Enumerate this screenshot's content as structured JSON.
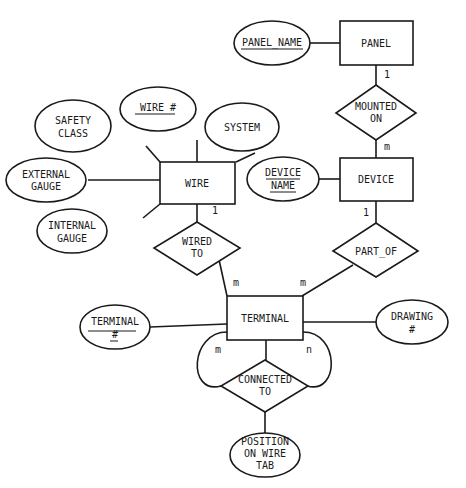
{
  "diagram": {
    "type": "entity-relationship",
    "entities": [
      {
        "id": "panel",
        "label": "PANEL"
      },
      {
        "id": "device",
        "label": "DEVICE"
      },
      {
        "id": "wire",
        "label": "WIRE"
      },
      {
        "id": "terminal",
        "label": "TERMINAL"
      }
    ],
    "relationships": [
      {
        "id": "mounted_on",
        "line1": "MOUNTED",
        "line2": "ON"
      },
      {
        "id": "part_of",
        "label": "PART_OF"
      },
      {
        "id": "wired_to",
        "line1": "WIRED",
        "line2": "TO"
      },
      {
        "id": "connected_to",
        "line1": "CONNECTED",
        "line2": "TO"
      }
    ],
    "attributes": {
      "panel_name": {
        "label": "PANEL_NAME",
        "key": true
      },
      "device_name": {
        "line1": "DEVICE",
        "line2": "NAME",
        "key": true
      },
      "wire_no": {
        "label": "WIRE #",
        "key": true
      },
      "safety_class": {
        "line1": "SAFETY",
        "line2": "CLASS"
      },
      "system": {
        "label": "SYSTEM"
      },
      "external_gauge": {
        "line1": "EXTERNAL",
        "line2": "GAUGE"
      },
      "internal_gauge": {
        "line1": "INTERNAL",
        "line2": "GAUGE"
      },
      "terminal_no": {
        "line1": "TERMINAL",
        "line2": "#",
        "key": true
      },
      "drawing_no": {
        "line1": "DRAWING",
        "line2": "#"
      },
      "position": {
        "line1": "POSITION",
        "line2": "ON WIRE",
        "line3": "TAB"
      }
    },
    "cardinalities": {
      "panel_mounted": "1",
      "device_mounted": "m",
      "device_partof": "1",
      "terminal_partof": "m",
      "wire_wired": "1",
      "terminal_wired": "m",
      "connected_left": "m",
      "connected_right": "n"
    }
  }
}
